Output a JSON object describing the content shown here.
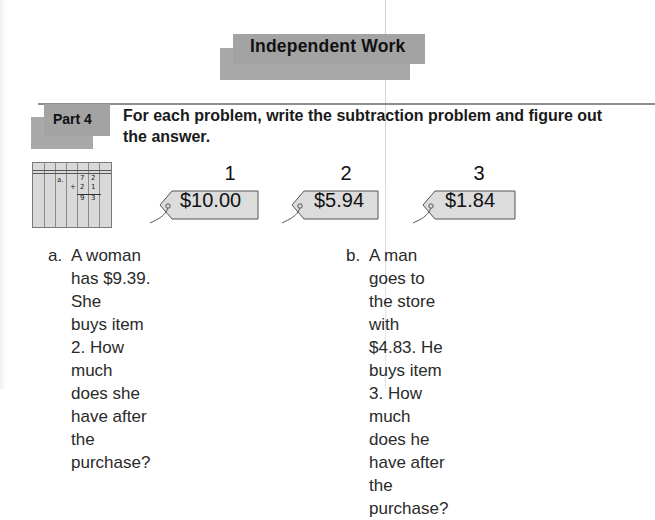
{
  "header": {
    "title": "Independent Work"
  },
  "part": {
    "label": "Part 4",
    "instruction": "For each problem, write the subtraction problem and figure out the answer."
  },
  "place_value_chart": {
    "rows": [
      {
        "label": "a.",
        "digits": [
          "7",
          "2"
        ]
      },
      {
        "label": "+",
        "digits": [
          "2",
          "1"
        ]
      },
      {
        "label": "",
        "digits": [
          "9",
          "3"
        ]
      }
    ]
  },
  "items": [
    {
      "number": "1",
      "price": "$10.00"
    },
    {
      "number": "2",
      "price": "$5.94"
    },
    {
      "number": "3",
      "price": "$1.84"
    }
  ],
  "problems": [
    {
      "letter": "a.",
      "text": "A woman has $9.39.  She\nbuys item 2.  How much\ndoes she have after the\npurchase?"
    },
    {
      "letter": "b.",
      "text": "A man goes to the store with\n$4.83.  He buys item 3.  How\nmuch does he have after the\npurchase?"
    }
  ],
  "colors": {
    "banner_gray": "#a3a3a3",
    "tag_fill": "#dcdcdc",
    "rule_gray": "#8e8e8e"
  }
}
